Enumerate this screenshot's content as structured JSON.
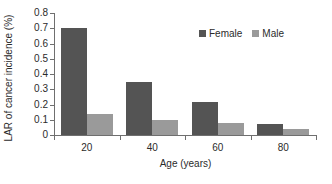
{
  "chart_data": {
    "type": "bar",
    "title": "",
    "subtitle": "",
    "xlabel": "Age (years)",
    "ylabel": "LAR of cancer incidence (%)",
    "categories": [
      "20",
      "40",
      "60",
      "80"
    ],
    "series": [
      {
        "name": "Female",
        "color": "#545454",
        "values": [
          0.7,
          0.345,
          0.215,
          0.075
        ]
      },
      {
        "name": "Male",
        "color": "#9a9a9a",
        "values": [
          0.14,
          0.1,
          0.08,
          0.04
        ]
      }
    ],
    "ylim": [
      0,
      0.8
    ],
    "ytick_labels": [
      "0.8",
      "0.7",
      "0.6",
      "0.5",
      "0.4",
      "0.3",
      "0.2",
      "0.1",
      "0"
    ],
    "ytick_values": [
      0.8,
      0.7,
      0.6,
      0.5,
      0.4,
      0.3,
      0.2,
      0.1,
      0
    ],
    "xtick_labels": [
      "20",
      "40",
      "60",
      "80"
    ],
    "grid": false,
    "legend_position": "top-right",
    "legend_entries": [
      "Female",
      "Male"
    ],
    "axis_color": "#6f6f6f",
    "text_color": "#2b2b2b",
    "background": "#ffffff"
  }
}
